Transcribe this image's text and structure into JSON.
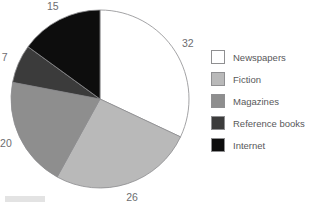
{
  "chart_data": {
    "type": "pie",
    "title": "",
    "categories": [
      "Newspapers",
      "Fiction",
      "Magazines",
      "Reference books",
      "Internet"
    ],
    "values": [
      32,
      26,
      20,
      7,
      15
    ],
    "value_labels": [
      "32",
      "26",
      "20",
      "7",
      "15"
    ],
    "colors": [
      "#ffffff",
      "#b9b9b9",
      "#8e8e8e",
      "#3b3b3b",
      "#0d0d0d"
    ],
    "total": 100,
    "start_angle_deg": 0,
    "direction": "clockwise",
    "legend_position": "right",
    "label_position": "outside",
    "grid": false,
    "xlabel": "",
    "ylabel": ""
  },
  "legend": {
    "items": [
      {
        "label": "Newspapers",
        "color": "#ffffff"
      },
      {
        "label": "Fiction",
        "color": "#b9b9b9"
      },
      {
        "label": "Magazines",
        "color": "#8e8e8e"
      },
      {
        "label": "Reference books",
        "color": "#3b3b3b"
      },
      {
        "label": "Internet",
        "color": "#0d0d0d"
      }
    ]
  },
  "geometry": {
    "center_x": 100,
    "center_y": 99,
    "radius": 89,
    "label_radius": 104
  }
}
